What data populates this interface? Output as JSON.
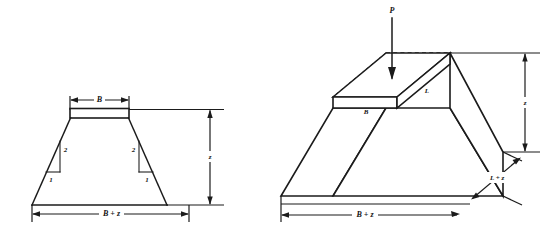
{
  "figure": {
    "background_color": "#ffffff",
    "ink_color": "#1b1b1b"
  },
  "left_view": {
    "name": "Cross-sectional elevation view",
    "labels": {
      "top_width": "B",
      "bottom_width": "B + z",
      "depth": "z",
      "slope_vertical_left": "2",
      "slope_horizontal_left": "1",
      "slope_vertical_right": "2",
      "slope_horizontal_right": "1"
    }
  },
  "right_view": {
    "name": "Isometric three-dimensional view",
    "labels": {
      "load": "P",
      "footing_width": "B",
      "footing_length": "L",
      "spread_length": "L + z",
      "spread_width": "B + z",
      "depth": "z"
    }
  }
}
